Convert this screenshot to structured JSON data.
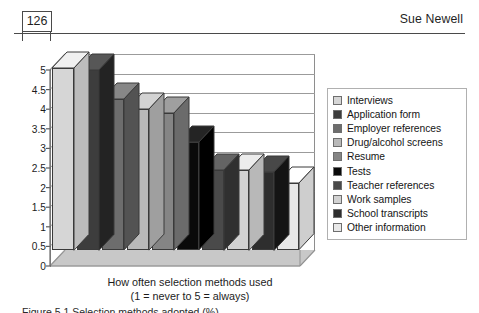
{
  "header": {
    "page_number": "126",
    "author": "Sue Newell"
  },
  "figure": {
    "caption": "Figure 5.1  Selection methods adopted (%)"
  },
  "chart_data": {
    "type": "bar",
    "title": "",
    "subtitle": "",
    "xlabel_line1": "How often selection methods used",
    "xlabel_line2": "(1 = never to 5 = always)",
    "ylabel": "",
    "ylim": [
      0,
      5
    ],
    "ytick_labels": [
      "5",
      "4.5",
      "4",
      "3.5",
      "3",
      "2.5",
      "2",
      "1.5",
      "1",
      "0.5",
      "0"
    ],
    "ytick_values": [
      5,
      4.5,
      4,
      3.5,
      3,
      2.5,
      2,
      1.5,
      1,
      0.5,
      0
    ],
    "grid": true,
    "legend_position": "right",
    "categories": [
      "Interviews",
      "Application form",
      "Employer references",
      "Drug/alcohol screens",
      "Resume",
      "Tests",
      "Teacher references",
      "Work samples",
      "School transcripts",
      "Other information"
    ],
    "values": [
      4.65,
      4.6,
      3.85,
      3.6,
      3.5,
      2.75,
      2.05,
      2.05,
      2.0,
      1.7
    ],
    "colors": [
      "#d6d6d6",
      "#3d3d3d",
      "#6d6d6d",
      "#b9b9b9",
      "#858585",
      "#0a0a0a",
      "#4a4a4a",
      "#d2d2d2",
      "#2e2e2e",
      "#e8e8e8"
    ]
  },
  "legend": {
    "items": [
      {
        "label": "Interviews",
        "color": "#d6d6d6"
      },
      {
        "label": "Application form",
        "color": "#3d3d3d"
      },
      {
        "label": "Employer references",
        "color": "#6d6d6d"
      },
      {
        "label": "Drug/alcohol screens",
        "color": "#b9b9b9"
      },
      {
        "label": "Resume",
        "color": "#858585"
      },
      {
        "label": "Tests",
        "color": "#0a0a0a"
      },
      {
        "label": "Teacher references",
        "color": "#4a4a4a"
      },
      {
        "label": "Work samples",
        "color": "#d2d2d2"
      },
      {
        "label": "School transcripts",
        "color": "#2e2e2e"
      },
      {
        "label": "Other information",
        "color": "#e8e8e8"
      }
    ]
  }
}
